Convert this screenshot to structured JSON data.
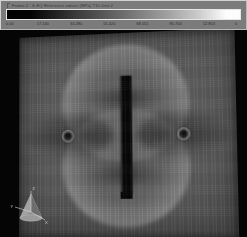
{
  "legend": {
    "title": "Frame 2 : S-EQ Reference values (MPa) T10 Unit 2",
    "colorbar": {
      "name": "grayscale-colorbar",
      "low_color": "#000000",
      "high_color": "#ffffff",
      "orientation": "horizontal"
    },
    "ticks": [
      {
        "label": "0.00",
        "pos": 2
      },
      {
        "label": "17.140",
        "pos": 16
      },
      {
        "label": "34.280",
        "pos": 30
      },
      {
        "label": "51.420",
        "pos": 44
      },
      {
        "label": "68.551",
        "pos": 58
      },
      {
        "label": "85.704",
        "pos": 72
      },
      {
        "label": "12.853",
        "pos": 86
      },
      {
        "label": "0",
        "pos": 97.5
      }
    ]
  },
  "viewport": {
    "name": "fea-contour-viewport",
    "background_color": "#050505",
    "model": {
      "name": "cracked-plate-model",
      "feature": "center-crack",
      "holes": 2,
      "shading": "grayscale-stress-contour"
    }
  },
  "triad": {
    "name": "orientation-triad",
    "axes": [
      {
        "label": "Z"
      },
      {
        "label": "Y"
      },
      {
        "label": "X"
      }
    ]
  },
  "chart_data": {
    "type": "heatmap",
    "title": "Frame 2 : S-EQ Reference values (MPa) T10 Unit 2",
    "xlabel": "",
    "ylabel": "",
    "colormap": "grayscale",
    "colorbar_ticks": [
      0.0,
      17.14,
      34.28,
      51.42,
      68.551,
      85.704,
      12.853,
      0
    ],
    "clim": [
      0.0,
      102.84
    ],
    "legend_position": "top",
    "grid": false,
    "features": [
      {
        "name": "center-crack",
        "x": 0.5,
        "y": 0.5,
        "width": 0.04,
        "height": 0.58,
        "value": 0.0
      },
      {
        "name": "upper-stress-lobe",
        "x": 0.5,
        "y": 0.28,
        "radius": 0.29,
        "value": 85.7
      },
      {
        "name": "lower-stress-lobe",
        "x": 0.5,
        "y": 0.74,
        "radius": 0.29,
        "value": 85.7
      },
      {
        "name": "left-hole",
        "x": 0.22,
        "y": 0.5,
        "radius": 0.03,
        "value": 0.0
      },
      {
        "name": "right-hole",
        "x": 0.78,
        "y": 0.5,
        "radius": 0.03,
        "value": 0.0
      }
    ]
  }
}
